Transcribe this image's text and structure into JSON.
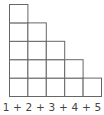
{
  "diagram": {
    "type": "staircase-squares",
    "column_heights": [
      5,
      4,
      3,
      2,
      1
    ],
    "caption": "1 + 2 + 3 + 4 + 5",
    "colors": {
      "stroke": "#666666",
      "fill": "#ffffff",
      "text": "#444444"
    }
  }
}
